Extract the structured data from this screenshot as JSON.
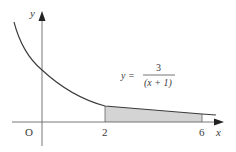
{
  "diagram": {
    "type": "function-graph",
    "equation": {
      "lhs": "y =",
      "numerator": "3",
      "denominator": "(x + 1)"
    },
    "axes": {
      "x_label": "x",
      "y_label": "y",
      "origin_label": "O"
    },
    "ticks": {
      "x_tick_1": "2",
      "x_tick_2": "6"
    },
    "shaded_region": {
      "from": 2,
      "to": 6,
      "fill": "#d4d4d4"
    },
    "colors": {
      "curve": "#3a3a3a",
      "axis": "#555555",
      "shade": "#d4d4d4"
    }
  }
}
